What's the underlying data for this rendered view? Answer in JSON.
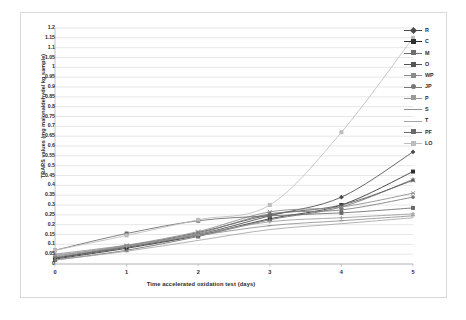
{
  "chart_data": {
    "type": "line",
    "title": "",
    "xlabel": "Time accelerated oxidation test (days)",
    "ylabel": "TBARS values (mg malonaldehyde/ kg sample)",
    "x": [
      0,
      1,
      2,
      3,
      4,
      5
    ],
    "xlim": [
      0,
      5
    ],
    "ylim": [
      0,
      1.2
    ],
    "xticks": [
      "0",
      "1",
      "2",
      "3",
      "4",
      "5"
    ],
    "yticks": [
      "0",
      "0.05",
      "0.1",
      "0.15",
      "0.2",
      "0.25",
      "0.3",
      "0.35",
      "0.4",
      "0.45",
      "0.5",
      "0.55",
      "0.6",
      "0.65",
      "0.7",
      "0.75",
      "0.8",
      "0.85",
      "0.9",
      "0.95",
      "1",
      "1.05",
      "1.1",
      "1.15",
      "1.2"
    ],
    "grid": "horizontal",
    "legend_position": "right",
    "series": [
      {
        "name": "R",
        "marker": "diamond",
        "color": "#4a4a4a",
        "values": [
          0.03,
          0.085,
          0.15,
          0.245,
          0.34,
          0.57
        ]
      },
      {
        "name": "C",
        "marker": "square",
        "color": "#2f2f2f",
        "values": [
          0.025,
          0.08,
          0.145,
          0.23,
          0.3,
          0.47
        ]
      },
      {
        "name": "M",
        "marker": "triangle",
        "color": "#6e6e6e",
        "values": [
          0.02,
          0.07,
          0.14,
          0.225,
          0.29,
          0.43
        ]
      },
      {
        "name": "O",
        "marker": "cross",
        "color": "#555555",
        "values": [
          0.03,
          0.09,
          0.16,
          0.25,
          0.3,
          0.425
        ]
      },
      {
        "name": "WP",
        "marker": "star",
        "color": "#8a8a8a",
        "values": [
          0.04,
          0.095,
          0.165,
          0.265,
          0.29,
          0.36
        ]
      },
      {
        "name": "JP",
        "marker": "circle",
        "color": "#777777",
        "values": [
          0.035,
          0.09,
          0.155,
          0.255,
          0.275,
          0.34
        ]
      },
      {
        "name": "P",
        "marker": "plus",
        "color": "#999999",
        "values": [
          0.045,
          0.09,
          0.15,
          0.215,
          0.235,
          0.255
        ]
      },
      {
        "name": "S",
        "marker": "line",
        "color": "#909090",
        "values": [
          0.05,
          0.095,
          0.145,
          0.195,
          0.22,
          0.245
        ]
      },
      {
        "name": "T",
        "marker": "none",
        "color": "#a5a5a5",
        "values": [
          0.02,
          0.065,
          0.12,
          0.175,
          0.205,
          0.235
        ]
      },
      {
        "name": "PF",
        "marker": "square",
        "color": "#6a6a6a",
        "values": [
          0.07,
          0.155,
          0.22,
          0.245,
          0.26,
          0.285
        ]
      },
      {
        "name": "LO",
        "marker": "square",
        "color": "#bdbdbd",
        "values": [
          0.07,
          0.145,
          0.225,
          0.3,
          0.67,
          1.15
        ]
      }
    ]
  },
  "axes": {
    "xlabel": "Time accelerated oxidation test (days)",
    "ylabel": "TBARS values (mg malonaldehyde/ kg sample)"
  },
  "legend": {
    "items": [
      {
        "label": "R"
      },
      {
        "label": "C"
      },
      {
        "label": "M"
      },
      {
        "label": "O"
      },
      {
        "label": "WP"
      },
      {
        "label": "JP"
      },
      {
        "label": "P"
      },
      {
        "label": "S"
      },
      {
        "label": "T"
      },
      {
        "label": "PF"
      },
      {
        "label": "LO"
      }
    ]
  },
  "style": {
    "grid_color": "#d6d6d6",
    "axis_color": "#b0b0b0",
    "frame_color": "#d9d9d9",
    "text_color": "#2b2b2b",
    "background": "#ffffff"
  }
}
